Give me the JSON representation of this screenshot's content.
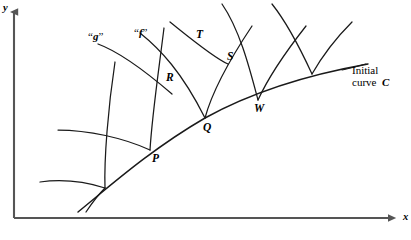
{
  "figure": {
    "background_color": "#ffffff",
    "stroke_color": "#1a1a1a",
    "axis_color": "#555555"
  },
  "axes": {
    "y_label": "y",
    "x_label": "x",
    "origin": {
      "x": 14,
      "y": 218
    },
    "y_top": {
      "x": 14,
      "y": 8
    },
    "x_right": {
      "x": 398,
      "y": 218
    }
  },
  "initial_curve": {
    "label_line1": "Initial",
    "label_line2": "curve",
    "label_symbol": "C",
    "label_x": 352,
    "label_y": 64
  },
  "families": [
    {
      "name": "g-family-label",
      "quoted_letter": "g",
      "open_quote": "“",
      "close_quote": "”",
      "x": 88,
      "y": 30
    },
    {
      "name": "f-family-label",
      "quoted_letter": "f",
      "open_quote": "“",
      "close_quote": "”",
      "x": 134,
      "y": 26
    }
  ],
  "points": [
    {
      "id": "P",
      "label": "P",
      "x": 150,
      "y": 150,
      "label_x": 152,
      "label_y": 152
    },
    {
      "id": "Q",
      "label": "Q",
      "x": 205,
      "y": 118,
      "label_x": 203,
      "label_y": 121
    },
    {
      "id": "W",
      "label": "W",
      "x": 258,
      "y": 100,
      "label_x": 254,
      "label_y": 102
    },
    {
      "id": "R",
      "label": "R",
      "x": 172,
      "y": 94,
      "label_x": 166,
      "label_y": 71
    },
    {
      "id": "T",
      "label": "T",
      "x": 203,
      "y": 43,
      "label_x": 196,
      "label_y": 28
    },
    {
      "id": "S",
      "label": "S",
      "x": 228,
      "y": 64,
      "label_x": 227,
      "label_y": 50
    }
  ]
}
